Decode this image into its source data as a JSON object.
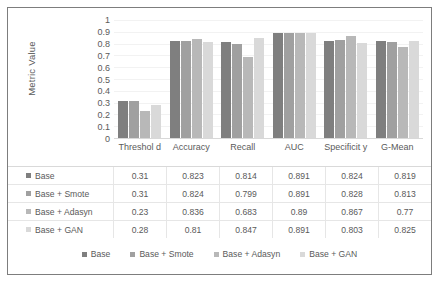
{
  "chart_data": {
    "type": "bar",
    "title": "",
    "xlabel": "",
    "ylabel": "Metric Value",
    "ylim": [
      0,
      1
    ],
    "yticks": [
      "1",
      "0.9",
      "0.8",
      "0.7",
      "0.6",
      "0.5",
      "0.4",
      "0.3",
      "0.2",
      "0.1",
      "0"
    ],
    "grid": true,
    "legend_position": "bottom",
    "categories": [
      "Threshold",
      "Accuracy",
      "Recall",
      "AUC",
      "Specificity",
      "G-Mean"
    ],
    "category_labels_display": [
      "Threshol d",
      "Accuracy",
      "Recall",
      "AUC",
      "Specificit y",
      "G-Mean"
    ],
    "series": [
      {
        "name": "Base",
        "color": "#7f7f7f",
        "values": [
          0.31,
          0.823,
          0.814,
          0.891,
          0.824,
          0.819
        ]
      },
      {
        "name": "Base + Smote",
        "color": "#a0a0a0",
        "values": [
          0.31,
          0.824,
          0.799,
          0.891,
          0.828,
          0.813
        ]
      },
      {
        "name": "Base + Adasyn",
        "color": "#b8b8b8",
        "values": [
          0.23,
          0.836,
          0.683,
          0.89,
          0.867,
          0.77
        ]
      },
      {
        "name": "Base + GAN",
        "color": "#d9d9d9",
        "values": [
          0.28,
          0.81,
          0.847,
          0.891,
          0.803,
          0.825
        ]
      }
    ],
    "table": {
      "rows": [
        {
          "label": "Base",
          "color": "#7f7f7f",
          "cells": [
            "0.31",
            "0.823",
            "0.814",
            "0.891",
            "0.824",
            "0.819"
          ]
        },
        {
          "label": "Base + Smote",
          "color": "#a0a0a0",
          "cells": [
            "0.31",
            "0.824",
            "0.799",
            "0.891",
            "0.828",
            "0.813"
          ]
        },
        {
          "label": "Base + Adasyn",
          "color": "#b8b8b8",
          "cells": [
            "0.23",
            "0.836",
            "0.683",
            "0.89",
            "0.867",
            "0.77"
          ]
        },
        {
          "label": "Base + GAN",
          "color": "#d9d9d9",
          "cells": [
            "0.28",
            "0.81",
            "0.847",
            "0.891",
            "0.803",
            "0.825"
          ]
        }
      ]
    },
    "legend": [
      {
        "label": "Base",
        "color": "#7f7f7f"
      },
      {
        "label": "Base + Smote",
        "color": "#a0a0a0"
      },
      {
        "label": "Base + Adasyn",
        "color": "#b8b8b8"
      },
      {
        "label": "Base + GAN",
        "color": "#d9d9d9"
      }
    ]
  }
}
